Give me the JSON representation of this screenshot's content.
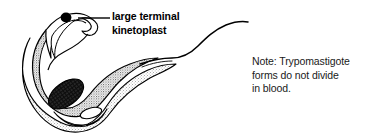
{
  "figure": {
    "background_color": "#ffffff",
    "ink_color": "#000000"
  },
  "callout": {
    "line1": "large terminal",
    "line2": "kinetoplast",
    "leader_line": "leader-line"
  },
  "note": {
    "line1": "Note: Trypomastigote",
    "line2": "forms do not divide",
    "line3": "in blood."
  },
  "organism": {
    "name": "trypomastigote",
    "parts": {
      "kinetoplast": "large terminal kinetoplast",
      "nucleus": "nucleus",
      "undulating_membrane": "undulating membrane",
      "flagellum": "flagellum",
      "body": "cell body"
    }
  }
}
